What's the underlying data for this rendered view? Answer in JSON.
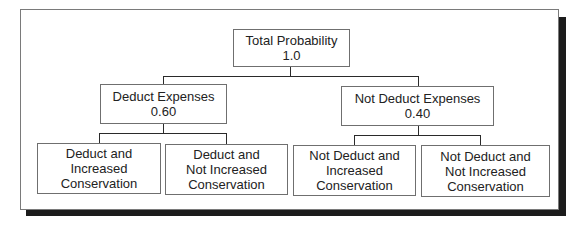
{
  "diagram": {
    "type": "probability-tree",
    "root": {
      "label": "Total Probability",
      "value": "1.0"
    },
    "level1": [
      {
        "label": "Deduct Expenses",
        "value": "0.60"
      },
      {
        "label": "Not Deduct Expenses",
        "value": "0.40"
      }
    ],
    "level2": [
      {
        "lines": [
          "Deduct and",
          "Increased",
          "Conservation"
        ],
        "parent": 0
      },
      {
        "lines": [
          "Deduct and",
          "Not Increased",
          "Conservation"
        ],
        "parent": 0
      },
      {
        "lines": [
          "Not Deduct and",
          "Increased",
          "Conservation"
        ],
        "parent": 1
      },
      {
        "lines": [
          "Not Deduct and",
          "Not Increased",
          "Conservation"
        ],
        "parent": 1
      }
    ],
    "colors": {
      "line": "#2a2a2a",
      "border": "#6f6f6f",
      "shadow": "#1c1c1c",
      "background": "#ffffff"
    }
  }
}
